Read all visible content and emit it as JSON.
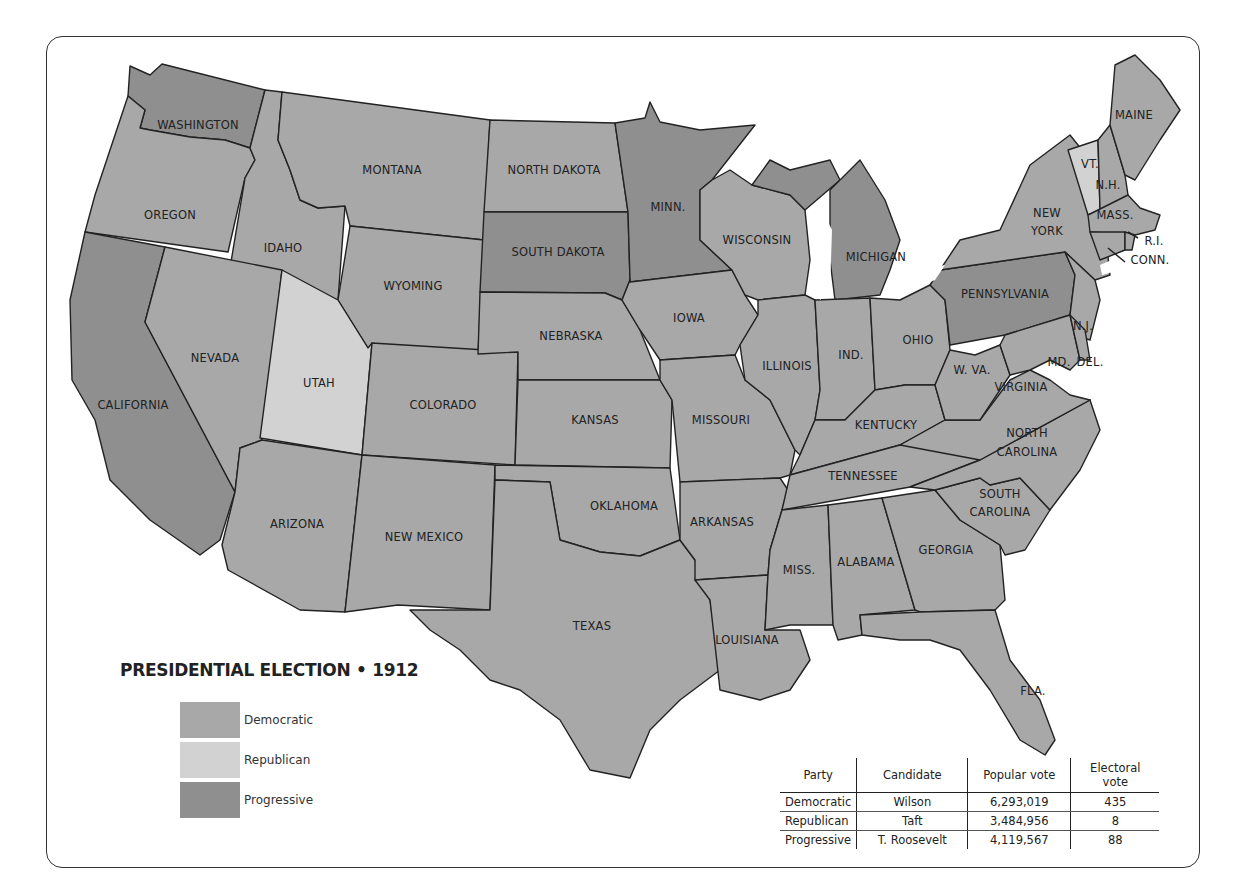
{
  "title": "PRESIDENTIAL ELECTION • 1912",
  "colors": {
    "democratic": "#a8a8a8",
    "republican": "#d2d2d2",
    "progressive": "#8f8f8f",
    "border": "#222222"
  },
  "legend": [
    {
      "party": "Democratic",
      "color": "#a8a8a8"
    },
    {
      "party": "Republican",
      "color": "#d2d2d2"
    },
    {
      "party": "Progressive",
      "color": "#8f8f8f"
    }
  ],
  "results_table": {
    "headers": [
      "Party",
      "Candidate",
      "Popular vote",
      "Electoral vote"
    ],
    "rows": [
      [
        "Democratic",
        "Wilson",
        "6,293,019",
        "435"
      ],
      [
        "Republican",
        "Taft",
        "3,484,956",
        "8"
      ],
      [
        "Progressive",
        "T. Roosevelt",
        "4,119,567",
        "88"
      ]
    ]
  },
  "states": {
    "washington": {
      "label": "WASHINGTON",
      "party": "Progressive"
    },
    "oregon": {
      "label": "OREGON",
      "party": "Democratic"
    },
    "california": {
      "label": "CALIFORNIA",
      "party": "Progressive"
    },
    "idaho": {
      "label": "IDAHO",
      "party": "Democratic"
    },
    "nevada": {
      "label": "NEVADA",
      "party": "Democratic"
    },
    "montana": {
      "label": "MONTANA",
      "party": "Democratic"
    },
    "wyoming": {
      "label": "WYOMING",
      "party": "Democratic"
    },
    "utah": {
      "label": "UTAH",
      "party": "Republican"
    },
    "colorado": {
      "label": "COLORADO",
      "party": "Democratic"
    },
    "arizona": {
      "label": "ARIZONA",
      "party": "Democratic"
    },
    "new_mexico": {
      "label": "NEW MEXICO",
      "party": "Democratic"
    },
    "north_dakota": {
      "label": "NORTH DAKOTA",
      "party": "Democratic"
    },
    "south_dakota": {
      "label": "SOUTH DAKOTA",
      "party": "Progressive"
    },
    "nebraska": {
      "label": "NEBRASKA",
      "party": "Democratic"
    },
    "kansas": {
      "label": "KANSAS",
      "party": "Democratic"
    },
    "oklahoma": {
      "label": "OKLAHOMA",
      "party": "Democratic"
    },
    "texas": {
      "label": "TEXAS",
      "party": "Democratic"
    },
    "minnesota": {
      "label": "MINN.",
      "party": "Progressive"
    },
    "iowa": {
      "label": "IOWA",
      "party": "Democratic"
    },
    "missouri": {
      "label": "MISSOURI",
      "party": "Democratic"
    },
    "arkansas": {
      "label": "ARKANSAS",
      "party": "Democratic"
    },
    "louisiana": {
      "label": "LOUISIANA",
      "party": "Democratic"
    },
    "wisconsin": {
      "label": "WISCONSIN",
      "party": "Democratic"
    },
    "illinois": {
      "label": "ILLINOIS",
      "party": "Democratic"
    },
    "michigan": {
      "label": "MICHIGAN",
      "party": "Progressive"
    },
    "indiana": {
      "label": "IND.",
      "party": "Democratic"
    },
    "ohio": {
      "label": "OHIO",
      "party": "Democratic"
    },
    "kentucky": {
      "label": "KENTUCKY",
      "party": "Democratic"
    },
    "tennessee": {
      "label": "TENNESSEE",
      "party": "Democratic"
    },
    "mississippi": {
      "label": "MISS.",
      "party": "Democratic"
    },
    "alabama": {
      "label": "ALABAMA",
      "party": "Democratic"
    },
    "georgia": {
      "label": "GEORGIA",
      "party": "Democratic"
    },
    "florida": {
      "label": "FLA.",
      "party": "Democratic"
    },
    "south_carolina": {
      "label1": "SOUTH",
      "label2": "CAROLINA",
      "party": "Democratic"
    },
    "north_carolina": {
      "label1": "NORTH",
      "label2": "CAROLINA",
      "party": "Democratic"
    },
    "virginia": {
      "label": "VIRGINIA",
      "party": "Democratic"
    },
    "west_virginia": {
      "label": "W. VA.",
      "party": "Democratic"
    },
    "pennsylvania": {
      "label": "PENNSYLVANIA",
      "party": "Progressive"
    },
    "new_york": {
      "label1": "NEW",
      "label2": "YORK",
      "party": "Democratic"
    },
    "new_jersey": {
      "label": "N.J.",
      "party": "Democratic"
    },
    "maryland": {
      "label": "MD.",
      "party": "Democratic"
    },
    "delaware": {
      "label": "DEL.",
      "party": "Democratic"
    },
    "vermont": {
      "label": "VT.",
      "party": "Republican"
    },
    "new_hampshire": {
      "label": "N.H.",
      "party": "Democratic"
    },
    "maine": {
      "label": "MAINE",
      "party": "Democratic"
    },
    "massachusetts": {
      "label": "MASS.",
      "party": "Democratic"
    },
    "rhode_island": {
      "label": "R.I.",
      "party": "Democratic"
    },
    "connecticut": {
      "label": "CONN.",
      "party": "Democratic"
    }
  }
}
